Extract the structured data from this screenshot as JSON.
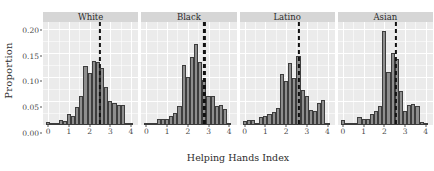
{
  "chart_data": {
    "type": "bar",
    "subtype": "faceted-histogram",
    "title": "",
    "xlabel": "Helping Hands Index",
    "ylabel": "Proportion",
    "xlim": [
      -0.25,
      4.35
    ],
    "ylim": [
      0,
      0.215
    ],
    "xticks": [
      0,
      1,
      2,
      3,
      4
    ],
    "xtick_labels": [
      "0",
      "1",
      "2",
      "3",
      "4"
    ],
    "yticks": [
      0.0,
      0.05,
      0.1,
      0.15,
      0.2
    ],
    "ytick_labels": [
      "0.00",
      "0.05",
      "0.10",
      "0.15",
      "0.20"
    ],
    "grid": true,
    "legend": false,
    "bar_fill": "#8e8e8e",
    "bar_edge": "#3d3d3d",
    "panel_background": "#ebebeb",
    "strip_background": "#d6d6d6",
    "gridline_color": "#ffffff",
    "vline_color": "#111111",
    "vline_style": "dashed",
    "facet_labels": [
      "White",
      "Black",
      "Latino",
      "Asian"
    ],
    "bin_width": 0.2,
    "panels": [
      {
        "label": "White",
        "mean_line": 2.5,
        "x": [
          0.0,
          0.2,
          0.4,
          0.6,
          0.8,
          1.0,
          1.2,
          1.4,
          1.6,
          1.8,
          2.0,
          2.2,
          2.4,
          2.6,
          2.8,
          3.0,
          3.2,
          3.4,
          3.6,
          3.8,
          4.0
        ],
        "values": [
          0.006,
          0.003,
          0.004,
          0.01,
          0.009,
          0.022,
          0.018,
          0.038,
          0.061,
          0.124,
          0.109,
          0.133,
          0.131,
          0.119,
          0.08,
          0.051,
          0.045,
          0.041,
          0.041,
          0.003,
          0.002
        ]
      },
      {
        "label": "Black",
        "mean_line": 2.8,
        "x": [
          0.0,
          0.2,
          0.4,
          0.6,
          0.8,
          1.0,
          1.2,
          1.4,
          1.6,
          1.8,
          2.0,
          2.2,
          2.4,
          2.6,
          2.8,
          3.0,
          3.2,
          3.4,
          3.6,
          3.8,
          4.0
        ],
        "values": [
          0.005,
          0.002,
          0.003,
          0.012,
          0.013,
          0.013,
          0.019,
          0.026,
          0.04,
          0.126,
          0.1,
          0.141,
          0.17,
          0.131,
          0.093,
          0.06,
          0.061,
          0.04,
          0.041,
          0.034,
          0.004
        ]
      },
      {
        "label": "Latino",
        "mean_line": 2.6,
        "x": [
          0.0,
          0.2,
          0.4,
          0.6,
          0.8,
          1.0,
          1.2,
          1.4,
          1.6,
          1.8,
          2.0,
          2.2,
          2.4,
          2.6,
          2.8,
          3.0,
          3.2,
          3.4,
          3.6,
          3.8,
          4.0
        ],
        "values": [
          0.008,
          0.01,
          0.01,
          0.004,
          0.016,
          0.019,
          0.022,
          0.028,
          0.035,
          0.107,
          0.091,
          0.13,
          0.099,
          0.145,
          0.074,
          0.061,
          0.032,
          0.03,
          0.046,
          0.052,
          0.004
        ]
      },
      {
        "label": "Asian",
        "mean_line": 2.55,
        "x": [
          0.0,
          0.2,
          0.4,
          0.6,
          0.8,
          1.0,
          1.2,
          1.4,
          1.6,
          1.8,
          2.0,
          2.2,
          2.4,
          2.6,
          2.8,
          3.0,
          3.2,
          3.4,
          3.6,
          3.8,
          4.0
        ],
        "values": [
          0.01,
          0.004,
          0.002,
          0.003,
          0.016,
          0.012,
          0.013,
          0.024,
          0.03,
          0.04,
          0.196,
          0.11,
          0.15,
          0.138,
          0.072,
          0.03,
          0.042,
          0.043,
          0.04,
          0.006,
          0.003
        ]
      }
    ]
  }
}
